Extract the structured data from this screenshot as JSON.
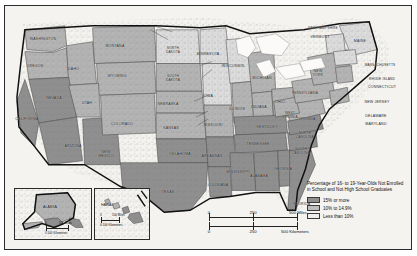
{
  "map": {
    "title": "United States choropleth map",
    "legend": {
      "title": "Percentage of\n16- to 19-Year-Olds\nNot Enrolled in School\nand Not High School\nGraduates",
      "classes": [
        {
          "label": "15% or more",
          "color": "#8f8f8f",
          "swatch": "sw-high"
        },
        {
          "label": "10% to 14.9%",
          "color": "#bdbdbd",
          "swatch": "sw-mid"
        },
        {
          "label": "Less than 10%",
          "color": "#eeeeee",
          "swatch": "sw-low"
        }
      ]
    },
    "scale_miles": {
      "zero": "0",
      "mid": "250",
      "max": "500",
      "unit": "Miles"
    },
    "scale_kilometers": {
      "zero": "0",
      "mid": "250",
      "max": "500",
      "unit": "Kilometers"
    },
    "insets": [
      {
        "name": "ALASKA",
        "scale_miles": {
          "zero": "0",
          "max": "500",
          "unit": "Miles"
        },
        "scale_kilometers": {
          "zero": "0",
          "max": "500",
          "unit": "Kilometers"
        }
      },
      {
        "name": "HAWAII",
        "scale_miles": {
          "zero": "0",
          "max": "100",
          "unit": "Miles"
        },
        "scale_kilometers": {
          "zero": "0",
          "max": "100",
          "unit": "Kilometers"
        }
      }
    ],
    "states": [
      {
        "name": "WASHINGTON",
        "label": "WASHINGTON",
        "x": 38,
        "y": 33,
        "cls": "c-mid"
      },
      {
        "name": "OREGON",
        "label": "OREGON",
        "x": 30,
        "y": 60,
        "cls": "c-mid"
      },
      {
        "name": "IDAHO",
        "label": "IDAHO",
        "x": 68,
        "y": 63,
        "cls": "c-mid"
      },
      {
        "name": "MONTANA",
        "label": "MONTANA",
        "x": 110,
        "y": 40,
        "cls": "c-mid"
      },
      {
        "name": "WYOMING",
        "label": "WYOMING",
        "x": 112,
        "y": 70,
        "cls": "c-mid"
      },
      {
        "name": "NEVADA",
        "label": "NEVADA",
        "x": 49,
        "y": 92,
        "cls": "c-high"
      },
      {
        "name": "UTAH",
        "label": "UTAH",
        "x": 82,
        "y": 97,
        "cls": "c-mid"
      },
      {
        "name": "CALIFORNIA",
        "label": "CALIFORNIA",
        "x": 22,
        "y": 113,
        "cls": "c-high"
      },
      {
        "name": "ARIZONA",
        "label": "ARIZONA",
        "x": 68,
        "y": 140,
        "cls": "c-high"
      },
      {
        "name": "NEW MEXICO",
        "label": "NEW\nMEXICO",
        "x": 101,
        "y": 148,
        "cls": "c-high"
      },
      {
        "name": "COLORADO",
        "label": "COLORADO",
        "x": 117,
        "y": 118,
        "cls": "c-mid"
      },
      {
        "name": "NORTH DAKOTA",
        "label": "NORTH\nDAKOTA",
        "x": 168,
        "y": 45,
        "cls": "c-low"
      },
      {
        "name": "SOUTH DAKOTA",
        "label": "SOUTH\nDAKOTA",
        "x": 168,
        "y": 73,
        "cls": "c-mid"
      },
      {
        "name": "NEBRASKA",
        "label": "NEBRASKA",
        "x": 163,
        "y": 98,
        "cls": "c-mid"
      },
      {
        "name": "KANSAS",
        "label": "KANSAS",
        "x": 166,
        "y": 122,
        "cls": "c-mid"
      },
      {
        "name": "OKLAHOMA",
        "label": "OKLAHOMA",
        "x": 175,
        "y": 148,
        "cls": "c-high"
      },
      {
        "name": "TEXAS",
        "label": "TEXAS",
        "x": 163,
        "y": 186,
        "cls": "c-high"
      },
      {
        "name": "MINNESOTA",
        "label": "MINNESOTA",
        "x": 203,
        "y": 48,
        "cls": "c-low"
      },
      {
        "name": "IOWA",
        "label": "IOWA",
        "x": 203,
        "y": 90,
        "cls": "c-low"
      },
      {
        "name": "MISSOURI",
        "label": "MISSOURI",
        "x": 208,
        "y": 119,
        "cls": "c-mid"
      },
      {
        "name": "ARKANSAS",
        "label": "ARKANSAS",
        "x": 207,
        "y": 150,
        "cls": "c-high"
      },
      {
        "name": "LOUISIANA",
        "label": "LOUISIANA",
        "x": 213,
        "y": 179,
        "cls": "c-high"
      },
      {
        "name": "WISCONSIN",
        "label": "WISCONSIN",
        "x": 228,
        "y": 60,
        "cls": "c-low"
      },
      {
        "name": "ILLINOIS",
        "label": "ILLINOIS",
        "x": 232,
        "y": 103,
        "cls": "c-mid"
      },
      {
        "name": "MICHIGAN",
        "label": "MICHIGAN",
        "x": 257,
        "y": 72,
        "cls": "c-mid"
      },
      {
        "name": "INDIANA",
        "label": "INDIANA",
        "x": 254,
        "y": 101,
        "cls": "c-mid"
      },
      {
        "name": "OHIO",
        "label": "OHIO",
        "x": 275,
        "y": 96,
        "cls": "c-mid"
      },
      {
        "name": "KENTUCKY",
        "label": "KENTUCKY",
        "x": 262,
        "y": 121,
        "cls": "c-high"
      },
      {
        "name": "TENNESSEE",
        "label": "TENNESSEE",
        "x": 253,
        "y": 138,
        "cls": "c-high"
      },
      {
        "name": "MISSISSIPPI",
        "label": "MISSISSIPPI",
        "x": 233,
        "y": 166,
        "cls": "c-high"
      },
      {
        "name": "ALABAMA",
        "label": "ALABAMA",
        "x": 254,
        "y": 170,
        "cls": "c-high"
      },
      {
        "name": "GEORGIA",
        "label": "GEORGIA",
        "x": 278,
        "y": 163,
        "cls": "c-high"
      },
      {
        "name": "FLORIDA",
        "label": "FLORIDA",
        "x": 297,
        "y": 198,
        "cls": "c-high"
      },
      {
        "name": "SOUTH CAROLINA",
        "label": "SOUTH\nCAROLINA",
        "x": 296,
        "y": 146,
        "cls": "c-high"
      },
      {
        "name": "NORTH CAROLINA",
        "label": "NORTH\nCAROLINA",
        "x": 300,
        "y": 130,
        "cls": "c-high"
      },
      {
        "name": "VIRGINIA",
        "label": "VIRGINIA",
        "x": 302,
        "y": 113,
        "cls": "c-mid"
      },
      {
        "name": "WEST VIRGINIA",
        "label": "WEST\nVIRGINIA",
        "x": 285,
        "y": 110,
        "cls": "c-mid"
      },
      {
        "name": "PENNSYLVANIA",
        "label": "PENNSYLVANIA",
        "x": 300,
        "y": 88,
        "cls": "c-mid"
      },
      {
        "name": "NEW YORK",
        "label": "NEW\nYORK",
        "x": 313,
        "y": 67,
        "cls": "c-mid"
      },
      {
        "name": "MAINE",
        "label": "MAINE",
        "x": 355,
        "y": 35,
        "cls": "c-low"
      },
      {
        "name": "NEW HAMPSHIRE",
        "label": "NEW HAMPSHIRE",
        "x": 318,
        "y": 23,
        "cls": "c-low"
      },
      {
        "name": "VERMONT",
        "label": "VERMONT",
        "x": 315,
        "y": 31,
        "cls": "c-low"
      },
      {
        "name": "MASSACHUSETTS",
        "label": "MASSACHUSETTS",
        "x": 375,
        "y": 60,
        "cls": "c-low"
      },
      {
        "name": "RHODE ISLAND",
        "label": "RHODE ISLAND",
        "x": 377,
        "y": 74,
        "cls": "c-low"
      },
      {
        "name": "CONNECTICUT",
        "label": "CONNECTICUT",
        "x": 377,
        "y": 81,
        "cls": "c-low"
      },
      {
        "name": "NEW JERSEY",
        "label": "NEW JERSEY",
        "x": 372,
        "y": 96,
        "cls": "c-mid"
      },
      {
        "name": "DELAWARE",
        "label": "DELAWARE",
        "x": 371,
        "y": 110,
        "cls": "c-mid"
      },
      {
        "name": "MARYLAND",
        "label": "MARYLAND",
        "x": 371,
        "y": 118,
        "cls": "c-mid"
      }
    ]
  }
}
